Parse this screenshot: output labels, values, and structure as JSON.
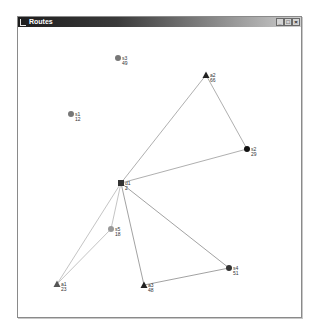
{
  "window": {
    "title": "Routes",
    "controls": {
      "minimize": "_",
      "maximize": "□",
      "close": "×"
    }
  },
  "diagram": {
    "nodes": [
      {
        "id": "s3",
        "label": "s3",
        "value": "49",
        "shape": "circle",
        "color": "#777777",
        "x": 118,
        "y": 58
      },
      {
        "id": "s1",
        "label": "s1",
        "value": "12",
        "shape": "circle",
        "color": "#777777",
        "x": 71,
        "y": 114
      },
      {
        "id": "a2",
        "label": "a2",
        "value": "66",
        "shape": "triangle",
        "color": "#222222",
        "x": 206,
        "y": 75
      },
      {
        "id": "s2",
        "label": "s2",
        "value": "29",
        "shape": "circle",
        "color": "#111111",
        "x": 247,
        "y": 149
      },
      {
        "id": "d1",
        "label": "d1",
        "value": "2",
        "shape": "square",
        "color": "#333333",
        "x": 121,
        "y": 183
      },
      {
        "id": "s5",
        "label": "s5",
        "value": "18",
        "shape": "circle",
        "color": "#999999",
        "x": 111,
        "y": 229
      },
      {
        "id": "a1",
        "label": "a1",
        "value": "23",
        "shape": "triangle",
        "color": "#555555",
        "x": 57,
        "y": 284
      },
      {
        "id": "a3",
        "label": "a3",
        "value": "48",
        "shape": "triangle",
        "color": "#222222",
        "x": 144,
        "y": 285
      },
      {
        "id": "s4",
        "label": "s4",
        "value": "51",
        "shape": "circle",
        "color": "#333333",
        "x": 229,
        "y": 268
      }
    ],
    "edges": [
      {
        "from": "d1",
        "to": "a2",
        "color": "#9a9a9a"
      },
      {
        "from": "a2",
        "to": "s2",
        "color": "#9a9a9a"
      },
      {
        "from": "s2",
        "to": "d1",
        "color": "#9a9a9a"
      },
      {
        "from": "d1",
        "to": "a3",
        "color": "#8a8a8a"
      },
      {
        "from": "a3",
        "to": "s4",
        "color": "#8a8a8a"
      },
      {
        "from": "s4",
        "to": "d1",
        "color": "#8a8a8a"
      },
      {
        "from": "d1",
        "to": "s5",
        "color": "#b5b5b5"
      },
      {
        "from": "s5",
        "to": "a1",
        "color": "#b5b5b5"
      },
      {
        "from": "a1",
        "to": "d1",
        "color": "#b5b5b5"
      }
    ]
  }
}
